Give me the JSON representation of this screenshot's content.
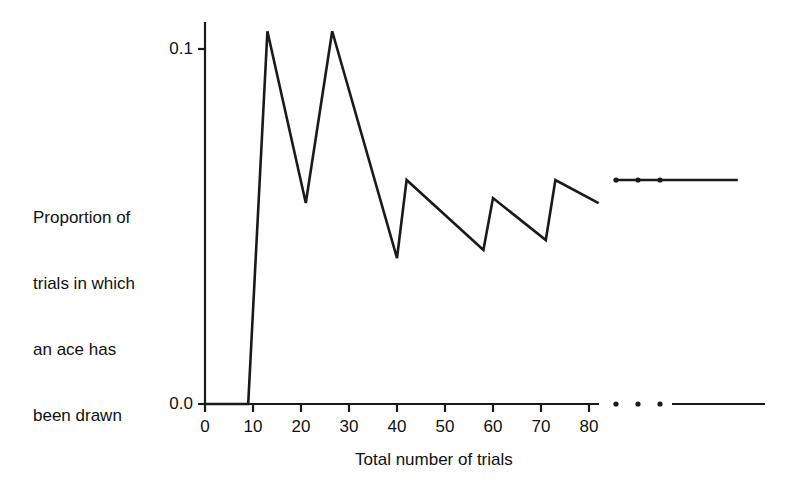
{
  "chart_data": {
    "type": "line",
    "title": "",
    "xlabel": "Total number of trials",
    "ylabel": "Proportion of trials in which an ace has been drawn",
    "ylabel_lines": [
      "Proportion of",
      "trials in which",
      "an ace has",
      "been drawn"
    ],
    "xlim": [
      0,
      85
    ],
    "ylim": [
      0.0,
      0.1
    ],
    "xticks": [
      0,
      10,
      20,
      30,
      40,
      50,
      60,
      70,
      80
    ],
    "xtick_labels": [
      "0",
      "10",
      "20",
      "30",
      "40",
      "50",
      "60",
      "70",
      "80"
    ],
    "yticks": [
      0.0,
      0.1
    ],
    "ytick_labels": [
      "0.0",
      "0.1"
    ],
    "grid": false,
    "legend": false,
    "line_color": "#1a1a1a",
    "axis_color": "#1a1a1a",
    "background_color": "#ffffff",
    "axis_break": {
      "present": true,
      "after_x": 82,
      "dot_count": 3,
      "note": "x-axis and data line are interrupted by three dots, then resume as a flat line at the long-run limit"
    },
    "series": [
      {
        "name": "Running proportion of trials with an ace",
        "x": [
          0,
          9,
          13,
          21,
          26.5,
          40,
          42,
          58,
          60,
          71,
          73,
          82
        ],
        "y": [
          0.0,
          0.0,
          0.105,
          0.0566,
          0.105,
          0.0411,
          0.0631,
          0.0434,
          0.058,
          0.0462,
          0.0631,
          0.0566
        ]
      },
      {
        "name": "Long-run limit (after break)",
        "x": [
          86,
          111
        ],
        "y": [
          0.0631,
          0.0631
        ]
      }
    ]
  }
}
